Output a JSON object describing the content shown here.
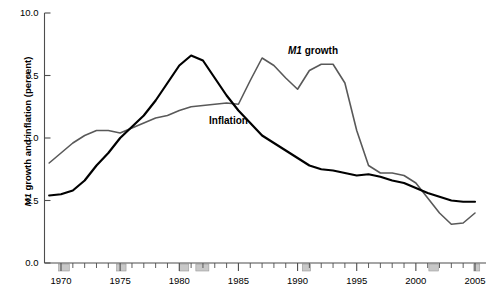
{
  "chart_data": {
    "type": "line",
    "title": "",
    "xlabel": "",
    "ylabel": "M1 growth and inflation (percent)",
    "xlim": [
      1969,
      2005
    ],
    "ylim": [
      0.0,
      10.0
    ],
    "grid": false,
    "legend_position": "inline-annotations",
    "y_ticks": [
      "0.0",
      "2.5",
      "5.0",
      "7.5",
      "10.0"
    ],
    "y_tick_values": [
      0.0,
      2.5,
      5.0,
      7.5,
      10.0
    ],
    "x_ticks": [
      "1970",
      "1975",
      "1980",
      "1985",
      "1990",
      "1995",
      "2000",
      "2005"
    ],
    "x_tick_values": [
      1970,
      1975,
      1980,
      1985,
      1990,
      1995,
      2000,
      2005
    ],
    "x_minor_tick_interval": 1,
    "series": [
      {
        "name": "M1 growth",
        "color": "#595959",
        "label_text": "M1 growth",
        "x": [
          1969,
          1970,
          1971,
          1972,
          1973,
          1974,
          1975,
          1976,
          1977,
          1978,
          1979,
          1980,
          1981,
          1982,
          1983,
          1984,
          1985,
          1986,
          1987,
          1988,
          1989,
          1990,
          1991,
          1992,
          1993,
          1994,
          1995,
          1996,
          1997,
          1998,
          1999,
          2000,
          2001,
          2002,
          2003,
          2004,
          2005
        ],
        "values": [
          4.0,
          4.4,
          4.8,
          5.1,
          5.3,
          5.3,
          5.2,
          5.4,
          5.6,
          5.8,
          5.9,
          6.1,
          6.25,
          6.3,
          6.35,
          6.4,
          6.35,
          7.3,
          8.2,
          7.9,
          7.4,
          6.95,
          7.7,
          7.95,
          7.95,
          7.2,
          5.3,
          3.9,
          3.6,
          3.6,
          3.5,
          3.2,
          2.6,
          2.0,
          1.55,
          1.6,
          2.0
        ]
      },
      {
        "name": "Inflation",
        "color": "#000000",
        "label_text": "Inflation",
        "x": [
          1969,
          1970,
          1971,
          1972,
          1973,
          1974,
          1975,
          1976,
          1977,
          1978,
          1979,
          1980,
          1981,
          1982,
          1983,
          1984,
          1985,
          1986,
          1987,
          1988,
          1989,
          1990,
          1991,
          1992,
          1993,
          1994,
          1995,
          1996,
          1997,
          1998,
          1999,
          2000,
          2001,
          2002,
          2003,
          2004,
          2005
        ],
        "values": [
          2.7,
          2.75,
          2.9,
          3.3,
          3.9,
          4.4,
          5.0,
          5.45,
          5.9,
          6.5,
          7.2,
          7.9,
          8.3,
          8.1,
          7.4,
          6.7,
          6.1,
          5.6,
          5.1,
          4.8,
          4.5,
          4.2,
          3.9,
          3.75,
          3.7,
          3.6,
          3.5,
          3.55,
          3.45,
          3.3,
          3.2,
          3.0,
          2.8,
          2.65,
          2.5,
          2.45,
          2.45
        ]
      }
    ],
    "recession_bands": [
      {
        "start": 1969.8,
        "end": 1970.7
      },
      {
        "start": 1974.7,
        "end": 1975.5
      },
      {
        "start": 1980.0,
        "end": 1980.8
      },
      {
        "start": 1981.4,
        "end": 1982.5
      },
      {
        "start": 1990.4,
        "end": 1991.1
      },
      {
        "start": 2001.1,
        "end": 2001.9
      },
      {
        "start": 2004.9,
        "end": 2005.4
      }
    ],
    "recession_band_color": "#c8c8c8"
  },
  "figure": {
    "y_axis_title_prefix": "M1",
    "y_axis_title_rest": " growth and inflation (percent)",
    "m1_label_prefix": "M1",
    "m1_label_rest": " growth",
    "inflation_label": "Inflation",
    "background_color": "#ffffff",
    "axis_color": "#4d4d4d"
  }
}
